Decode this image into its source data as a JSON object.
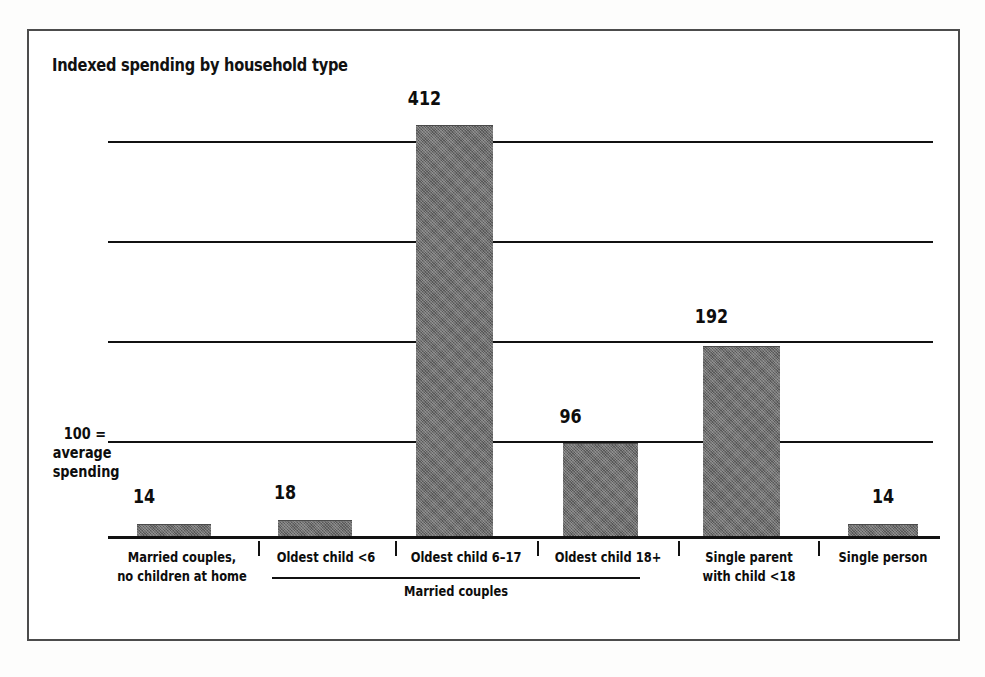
{
  "chart_data": {
    "type": "bar",
    "title": "Indexed spending by household type",
    "xlabel": "",
    "ylabel": "100 = average spending",
    "ylim": [
      0,
      440
    ],
    "grid": true,
    "gridlines": [
      100,
      200,
      300,
      400
    ],
    "legend": "none",
    "categories": [
      "Married couples,\nno children at home",
      "Oldest child <6",
      "Oldest child 6–17",
      "Oldest child 18+",
      "Single parent\nwith child <18",
      "Single person"
    ],
    "values": [
      14,
      18,
      412,
      96,
      192,
      14
    ],
    "annotations": [
      "100 = average spending",
      "Married couples"
    ],
    "group_bracket": {
      "label": "Married couples",
      "spans_categories": [
        "Oldest child <6",
        "Oldest child 6–17",
        "Oldest child 18+"
      ]
    }
  },
  "frame": {
    "border_color": "#4c4c4c"
  },
  "title": {
    "text": "Indexed spending by household type"
  },
  "y_axis": {
    "line1": "100 =",
    "line2": "average",
    "line3": "spending"
  },
  "bars": [
    {
      "value_label": "14",
      "category_line1": "Married couples,",
      "category_line2": "no children at home"
    },
    {
      "value_label": "18",
      "category_line1": "Oldest child <6",
      "category_line2": ""
    },
    {
      "value_label": "412",
      "category_line1": "Oldest child 6–17",
      "category_line2": ""
    },
    {
      "value_label": "96",
      "category_line1": "Oldest child 18+",
      "category_line2": ""
    },
    {
      "value_label": "192",
      "category_line1": "Single parent",
      "category_line2": "with child <18"
    },
    {
      "value_label": "14",
      "category_line1": "Single person",
      "category_line2": ""
    }
  ],
  "group": {
    "label": "Married couples"
  },
  "colors": {
    "bar_fill": "#6e6e6e",
    "ink": "#111111",
    "paper": "#ffffff"
  }
}
